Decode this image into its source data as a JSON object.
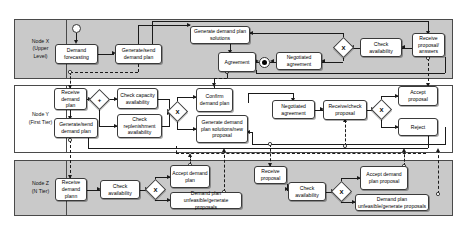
{
  "diagram": {
    "type": "bpmn-collaboration",
    "pools": [
      {
        "id": "nodeX",
        "label": "Node X\n(Upper\nLevel)",
        "label_lines": [
          "Node X",
          "(Upper",
          "Level)"
        ],
        "shaded": true
      },
      {
        "id": "nodeY",
        "label": "Node Y\n(First Tier)",
        "label_lines": [
          "Node Y",
          "(First Tier)"
        ],
        "shaded": false
      },
      {
        "id": "nodeZ",
        "label": "Node Z\n(N Tier)",
        "label_lines": [
          "Node Z",
          "(N Tier)"
        ],
        "shaded": true
      }
    ],
    "tasks": {
      "x_demand_forecasting": "Demand forecasting",
      "x_generate_send_demand_plan": "Generate/send demand plan",
      "x_generate_demand_plan_solutions": "Generate demand plan solutions",
      "x_agreement": "Agreement",
      "x_negotiated_agreement": "Negotiated agreement",
      "x_check_availability": "Check availability",
      "x_receive_proposal_answers": "Receive proposal/ answers",
      "y_receive_demand_plan": "Receive demand plan",
      "y_generate_send_demand_plan": "Generate/send demand plan",
      "y_check_capacity_availability": "Check capacity availability",
      "y_check_replenishment_availability": "Check replenishment availability",
      "y_confirm_demand_plan": "Confirm demand plan",
      "y_generate_demand_plan_solutions_new_proposal": "Generate demand plan solutions/new proposal",
      "y_negotiated_agreement": "Negotiated agreement",
      "y_receive_check_proposal": "Receive/check proposal",
      "y_accept_proposal": "Accept proposal",
      "y_reject": "Reject",
      "z_receive_demand_plann": "Receive demand plann",
      "z_check_availability_1": "Check availability",
      "z_accept_demand_plan": "Accept demand plan",
      "z_demand_plan_unfeasible_1": "Demand plan unfeasible/generate proposals",
      "z_receive_proposal": "Receive proposal",
      "z_check_availability_2": "Check availability",
      "z_accept_demand_plan_proposal": "Accept demand plan proposal",
      "z_demand_plan_unfeasible_2": "Demand plan unfeasible/generate proposals"
    },
    "gateways": {
      "x_gw_x": "X",
      "y_gw_plus": "+",
      "y_gw_x1": "X",
      "y_gw_x2": "X",
      "z_gw_x1": "X",
      "z_gw_x2": "X"
    },
    "events": {
      "x_start": "start-event",
      "x_end": "end-event"
    },
    "colors": {
      "pool_shaded": "#c9c9c9",
      "pool_plain": "#ffffff",
      "task_fill": "#ffffff",
      "stroke": "#3a3a3a",
      "flow": "#1a1a1a"
    }
  }
}
